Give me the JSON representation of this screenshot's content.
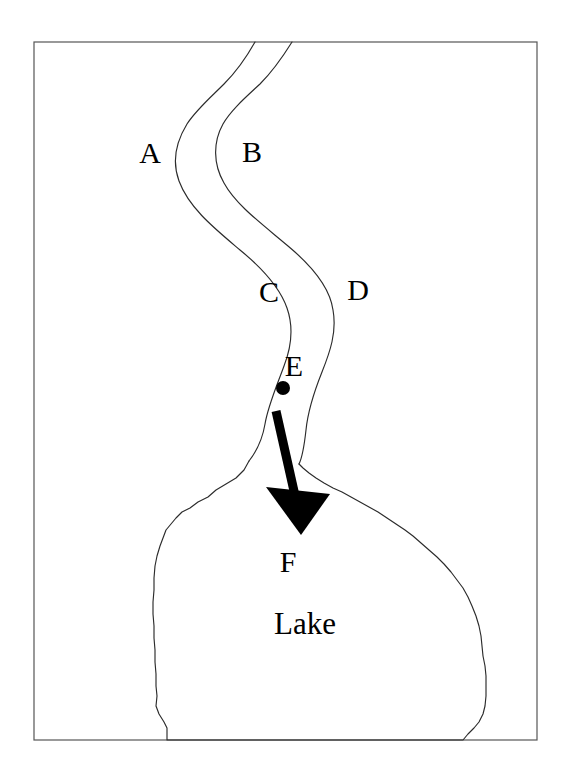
{
  "figure": {
    "background_color": "#ffffff",
    "frame": {
      "name": "map-border",
      "color": "#555555",
      "x": 34,
      "y": 42,
      "width": 503,
      "height": 698
    }
  },
  "labels": {
    "a": "A",
    "b": "B",
    "c": "C",
    "d": "D",
    "e": "E",
    "f": "F",
    "lake": "Lake"
  },
  "label_positions": {
    "a": {
      "x": 150,
      "y": 163
    },
    "b": {
      "x": 252,
      "y": 162
    },
    "c": {
      "x": 269,
      "y": 302
    },
    "d": {
      "x": 358,
      "y": 300
    },
    "e": {
      "x": 294,
      "y": 376
    },
    "f": {
      "x": 288,
      "y": 572
    },
    "lake": {
      "x": 305,
      "y": 634
    }
  },
  "features": {
    "river": {
      "name": "river-channel",
      "left_bank_color": "#2b2b2b",
      "right_bank_color": "#2b2b2b",
      "left_bank_label": "A",
      "right_bank_label": "B",
      "mid_left_label": "C",
      "mid_right_label": "D"
    },
    "lake": {
      "name": "lake-outline",
      "color": "#2b2b2b",
      "label": "Lake"
    },
    "sampling_point": {
      "name": "sampling-point-e",
      "label": "E",
      "color": "#000000",
      "x": 283,
      "y": 388,
      "radius": 7
    },
    "flow_arrow": {
      "name": "flow-direction-arrow",
      "label": "F",
      "color": "#000000",
      "start": {
        "x": 276,
        "y": 410
      },
      "end": {
        "x": 300,
        "y": 534
      }
    }
  },
  "chart_data": {
    "type": "diagram",
    "annotations": [
      {
        "id": "A",
        "kind": "bank-label",
        "x": 150,
        "y": 153,
        "description": "left bank of river, upper reach"
      },
      {
        "id": "B",
        "kind": "bank-label",
        "x": 252,
        "y": 152,
        "description": "right bank of river, upper reach"
      },
      {
        "id": "C",
        "kind": "bank-label",
        "x": 269,
        "y": 292,
        "description": "left bank of river, middle reach"
      },
      {
        "id": "D",
        "kind": "bank-label",
        "x": 358,
        "y": 290,
        "description": "right bank of river, middle reach"
      },
      {
        "id": "E",
        "kind": "point-label",
        "x": 294,
        "y": 366,
        "description": "sampling point marked with filled dot"
      },
      {
        "id": "F",
        "kind": "arrow-label",
        "x": 288,
        "y": 562,
        "description": "arrow tip, flow direction into lake"
      },
      {
        "id": "Lake",
        "kind": "area-label",
        "x": 305,
        "y": 624,
        "description": "lake water body"
      }
    ],
    "paths": {
      "river_left_bank": "M 255 42 C 233 82 206 104 189 126 C 174 146 171 166 180 186 C 196 218 246 245 272 278 C 292 304 288 332 280 356 C 272 382 264 404 262 424 C 258 448 250 454 248 462",
      "river_right_bank": "M 292 42 C 272 74 242 96 227 118 C 212 140 212 164 226 186 C 244 214 292 238 318 268 C 338 292 336 318 328 342 C 320 368 312 382 308 404 C 304 432 300 450 298 464",
      "lake_outline": "M 248 462 C 238 476 222 488 206 498 C 190 508 175 520 168 536 C 160 552 156 574 154 598 C 152 624 153 652 155 678 C 156 700 156 714 157 722 L 168 730 L 168 740 L 465 740 L 470 732 C 480 724 486 712 487 698 C 488 676 487 652 484 628 C 480 606 473 586 462 570 C 448 550 428 534 408 520 C 388 506 366 492 346 480 C 326 470 310 464 298 464 Z",
      "arrow_shaft": "M 276 410 L 297 508",
      "arrow_head": "M 268 486 L 330 496 L 300 534 Z"
    },
    "grid": false,
    "legend": null
  }
}
